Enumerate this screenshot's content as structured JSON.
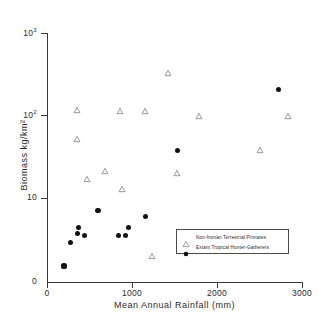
{
  "chart_data": {
    "type": "scatter",
    "title": "",
    "xlabel": "Mean Annual Rainfall  (mm)",
    "ylabel": "Biomass  kg/km²",
    "xlim": [
      0,
      3000
    ],
    "ylim": [
      1,
      1000
    ],
    "yscale": "log",
    "xscale": "linear",
    "grid": false,
    "legend_position": "lower-right-inside",
    "xticks": [
      {
        "value": 0,
        "label": "0"
      },
      {
        "value": 1000,
        "label": "1000"
      },
      {
        "value": 2000,
        "label": "2000"
      },
      {
        "value": 3000,
        "label": "3000"
      }
    ],
    "yticks": [
      {
        "value": 1,
        "label": "0",
        "exponent": ""
      },
      {
        "value": 10,
        "label": "10",
        "exponent": ""
      },
      {
        "value": 100,
        "label": "10",
        "exponent": "2"
      },
      {
        "value": 1000,
        "label": "10",
        "exponent": "3"
      }
    ],
    "series": [
      {
        "name": "Non-human Terrestrial Primates",
        "marker": "open-triangle",
        "color": "#777777",
        "points": [
          {
            "x": 350,
            "y": 118
          },
          {
            "x": 350,
            "y": 52
          },
          {
            "x": 470,
            "y": 17
          },
          {
            "x": 680,
            "y": 21
          },
          {
            "x": 860,
            "y": 113
          },
          {
            "x": 880,
            "y": 13
          },
          {
            "x": 1150,
            "y": 113
          },
          {
            "x": 1230,
            "y": 2.0
          },
          {
            "x": 1420,
            "y": 330
          },
          {
            "x": 1530,
            "y": 20
          },
          {
            "x": 1790,
            "y": 98
          },
          {
            "x": 2510,
            "y": 38
          },
          {
            "x": 2830,
            "y": 98
          }
        ]
      },
      {
        "name": "Extant Tropical Hunter-Gatherers",
        "marker": "filled-circle",
        "color": "#111111",
        "points": [
          {
            "x": 200,
            "y": 1.5
          },
          {
            "x": 280,
            "y": 2.9
          },
          {
            "x": 370,
            "y": 4.4
          },
          {
            "x": 360,
            "y": 3.7
          },
          {
            "x": 440,
            "y": 3.5
          },
          {
            "x": 600,
            "y": 7.0
          },
          {
            "x": 840,
            "y": 3.5
          },
          {
            "x": 920,
            "y": 3.5
          },
          {
            "x": 960,
            "y": 4.4
          },
          {
            "x": 1160,
            "y": 6.0
          },
          {
            "x": 1540,
            "y": 38
          },
          {
            "x": 2720,
            "y": 205
          }
        ]
      }
    ],
    "legend": [
      {
        "label": "Non-human Terrestrial Primates",
        "marker": "open-triangle"
      },
      {
        "label": "Extant Tropical Hunter-Gatherers",
        "marker": "filled-circle"
      }
    ]
  }
}
